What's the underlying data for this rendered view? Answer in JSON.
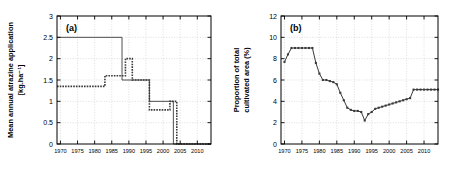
{
  "figure": {
    "background": "#ffffff",
    "line_color": "#3a3a3a",
    "grid_color": "#c8c8c8",
    "axis_color": "#000000"
  },
  "panels": [
    {
      "tag": "(a)",
      "ylabel_line1": "Mean annual atrazine application",
      "ylabel_line2": "[kg.ha⁻¹]",
      "ytick_labels": [
        "0",
        "0.5",
        "1",
        "1.5",
        "2",
        "2.5",
        "3"
      ],
      "xtick_labels": [
        "1970",
        "1975",
        "1980",
        "1985",
        "1990",
        "1995",
        "2000",
        "2005",
        "2010"
      ]
    },
    {
      "tag": "(b)",
      "ylabel_line1": "Proportion of total",
      "ylabel_line2": "cultivated area (%)",
      "ytick_labels": [
        "0",
        "2",
        "4",
        "6",
        "8",
        "10",
        "12"
      ],
      "xtick_labels": [
        "1970",
        "1975",
        "1980",
        "1985",
        "1990",
        "1995",
        "2000",
        "2005",
        "2010"
      ]
    }
  ],
  "chart_data": [
    {
      "type": "line",
      "title": "(a)",
      "xlabel": "",
      "ylabel": "Mean annual atrazine application [kg.ha-1]",
      "xlim": [
        1969,
        2014
      ],
      "ylim": [
        0,
        3
      ],
      "xticks": [
        1970,
        1975,
        1980,
        1985,
        1990,
        1995,
        2000,
        2005,
        2010
      ],
      "yticks": [
        0,
        0.5,
        1,
        1.5,
        2,
        2.5,
        3
      ],
      "grid": true,
      "legend": "none",
      "style": "step",
      "series": [
        {
          "name": "upper step series (solid)",
          "linestyle": "solid",
          "x": [
            1969,
            1988,
            1988,
            1996,
            1996,
            2003,
            2003,
            2004,
            2004,
            2014
          ],
          "y": [
            2.5,
            2.5,
            1.5,
            1.5,
            1.0,
            1.0,
            0.0,
            0.0,
            0.0,
            0.0
          ]
        },
        {
          "name": "lower step series (dashed)",
          "linestyle": "dashed",
          "x": [
            1969,
            1983,
            1983,
            1989,
            1989,
            1991,
            1991,
            1996,
            1996,
            2002,
            2002,
            2004,
            2004,
            2014
          ],
          "y": [
            1.35,
            1.35,
            1.6,
            1.6,
            2.0,
            2.0,
            1.5,
            1.5,
            0.8,
            0.8,
            1.0,
            1.0,
            0.0,
            0.0
          ]
        }
      ]
    },
    {
      "type": "line",
      "title": "(b)",
      "xlabel": "",
      "ylabel": "Proportion of total cultivated area (%)",
      "xlim": [
        1969,
        2014
      ],
      "ylim": [
        0,
        12
      ],
      "xticks": [
        1970,
        1975,
        1980,
        1985,
        1990,
        1995,
        2000,
        2005,
        2010
      ],
      "yticks": [
        0,
        2,
        4,
        6,
        8,
        10,
        12
      ],
      "grid": true,
      "legend": "none",
      "style": "line-with-markers",
      "series": [
        {
          "name": "proportion of total cultivated area",
          "linestyle": "solid",
          "markers": true,
          "x": [
            1970,
            1971,
            1972,
            1973,
            1974,
            1975,
            1976,
            1977,
            1978,
            1979,
            1980,
            1981,
            1982,
            1983,
            1984,
            1985,
            1986,
            1987,
            1988,
            1989,
            1990,
            1991,
            1992,
            1993,
            1994,
            1995,
            1996,
            1997,
            1998,
            1999,
            2000,
            2001,
            2002,
            2003,
            2004,
            2005,
            2006,
            2007,
            2008,
            2009,
            2010,
            2011,
            2012,
            2013,
            2014
          ],
          "y": [
            7.7,
            8.4,
            9.0,
            9.0,
            9.0,
            9.0,
            9.0,
            9.0,
            9.0,
            7.6,
            6.6,
            6.0,
            6.0,
            5.9,
            5.8,
            5.6,
            4.8,
            4.1,
            3.4,
            3.2,
            3.1,
            3.1,
            3.0,
            2.2,
            2.8,
            3.0,
            3.3,
            3.4,
            3.5,
            3.6,
            3.7,
            3.8,
            3.9,
            4.0,
            4.1,
            4.2,
            4.3,
            5.1,
            5.1,
            5.1,
            5.1,
            5.1,
            5.1,
            5.1,
            5.1
          ]
        }
      ]
    }
  ]
}
